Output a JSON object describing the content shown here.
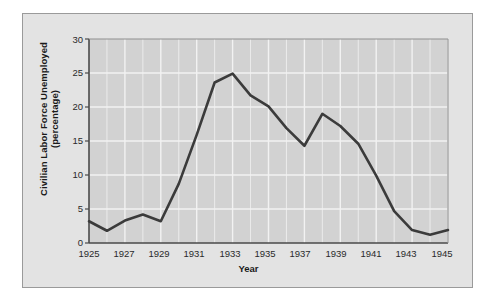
{
  "chart_data": {
    "type": "line",
    "title": "",
    "xlabel": "Year",
    "ylabel_line1": "Civilian Labor Force Unemployed",
    "ylabel_line2": "(percentage)",
    "ylabel": "Civilian Labor Force Unemployed (percentage)",
    "xlim": [
      1925,
      1945
    ],
    "ylim": [
      0,
      30
    ],
    "grid": true,
    "legend": "none",
    "x_tick_labels": [
      "1925",
      "1927",
      "1929",
      "1931",
      "1933",
      "1935",
      "1937",
      "1939",
      "1941",
      "1943",
      "1945"
    ],
    "x_tick_values": [
      1925,
      1927,
      1929,
      1931,
      1933,
      1935,
      1937,
      1939,
      1941,
      1943,
      1945
    ],
    "y_tick_labels": [
      "0",
      "5",
      "10",
      "15",
      "20",
      "25",
      "30"
    ],
    "y_tick_values": [
      0,
      5,
      10,
      15,
      20,
      25,
      30
    ],
    "x": [
      1925,
      1926,
      1927,
      1928,
      1929,
      1930,
      1931,
      1932,
      1933,
      1934,
      1935,
      1936,
      1937,
      1938,
      1939,
      1940,
      1941,
      1942,
      1943,
      1944,
      1945
    ],
    "values": [
      3.2,
      1.8,
      3.3,
      4.2,
      3.2,
      8.7,
      15.9,
      23.6,
      24.9,
      21.7,
      20.1,
      16.9,
      14.3,
      19.0,
      17.2,
      14.6,
      9.9,
      4.7,
      1.9,
      1.2,
      1.9
    ],
    "series": [
      {
        "name": "Civilian Labor Force Unemployed",
        "values": [
          3.2,
          1.8,
          3.3,
          4.2,
          3.2,
          8.7,
          15.9,
          23.6,
          24.9,
          21.7,
          20.1,
          16.9,
          14.3,
          19.0,
          17.2,
          14.6,
          9.9,
          4.7,
          1.9,
          1.2,
          1.9
        ]
      }
    ]
  },
  "style": {
    "page_background": "#ffffff",
    "panel_background": "#e3e3e3",
    "panel_border": "#9a9a9a",
    "plot_background": "#d2d2d2",
    "gridline_color": "#f2f2f2",
    "axis_color": "#555555",
    "line_color": "#3b3b3b",
    "text_color": "#1a1a1a"
  }
}
